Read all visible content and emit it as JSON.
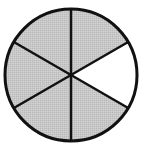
{
  "diagram": {
    "type": "fraction-circle",
    "total_parts": 6,
    "shaded_parts": 5,
    "unshaded_parts": 1,
    "fraction_shaded": "5/6",
    "sectors": [
      {
        "index": 0,
        "position": "top-right",
        "shaded": true
      },
      {
        "index": 1,
        "position": "right",
        "shaded": false
      },
      {
        "index": 2,
        "position": "bottom-right",
        "shaded": true
      },
      {
        "index": 3,
        "position": "bottom-left",
        "shaded": true
      },
      {
        "index": 4,
        "position": "left",
        "shaded": true
      },
      {
        "index": 5,
        "position": "top-left",
        "shaded": true
      }
    ],
    "colors": {
      "shaded": "#c4c4c4",
      "unshaded": "#ffffff",
      "stroke": "#111111"
    }
  }
}
